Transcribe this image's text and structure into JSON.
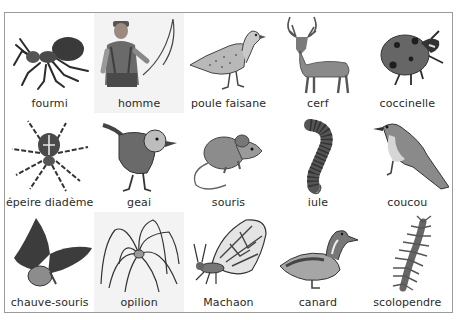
{
  "plate": {
    "rows": 3,
    "columns": 5,
    "colors": {
      "border": "#9a9a9a",
      "cell_shade": "#f3f3f3",
      "label_text": "#2a2a2a",
      "ink": "#222222",
      "fill_gray": "#7a7a7a"
    }
  },
  "cells": [
    {
      "label": "fourmi",
      "icon": "ant-icon",
      "shaded": false
    },
    {
      "label": "homme",
      "icon": "fisherman-icon",
      "shaded": true
    },
    {
      "label": "poule faisane",
      "icon": "hen-pheasant-icon",
      "shaded": false
    },
    {
      "label": "cerf",
      "icon": "deer-icon",
      "shaded": false
    },
    {
      "label": "coccinelle",
      "icon": "ladybug-icon",
      "shaded": false
    },
    {
      "label": "épeire diadème",
      "icon": "garden-spider-icon",
      "shaded": false
    },
    {
      "label": "geai",
      "icon": "jay-icon",
      "shaded": false
    },
    {
      "label": "souris",
      "icon": "mouse-icon",
      "shaded": false
    },
    {
      "label": "iule",
      "icon": "millipede-icon",
      "shaded": false
    },
    {
      "label": "coucou",
      "icon": "cuckoo-icon",
      "shaded": false
    },
    {
      "label": "chauve-souris",
      "icon": "bat-icon",
      "shaded": false
    },
    {
      "label": "opilion",
      "icon": "harvestman-icon",
      "shaded": true
    },
    {
      "label": "Machaon",
      "icon": "swallowtail-butterfly-icon",
      "shaded": false
    },
    {
      "label": "canard",
      "icon": "duck-icon",
      "shaded": false
    },
    {
      "label": "scolopendre",
      "icon": "centipede-icon",
      "shaded": false
    }
  ]
}
